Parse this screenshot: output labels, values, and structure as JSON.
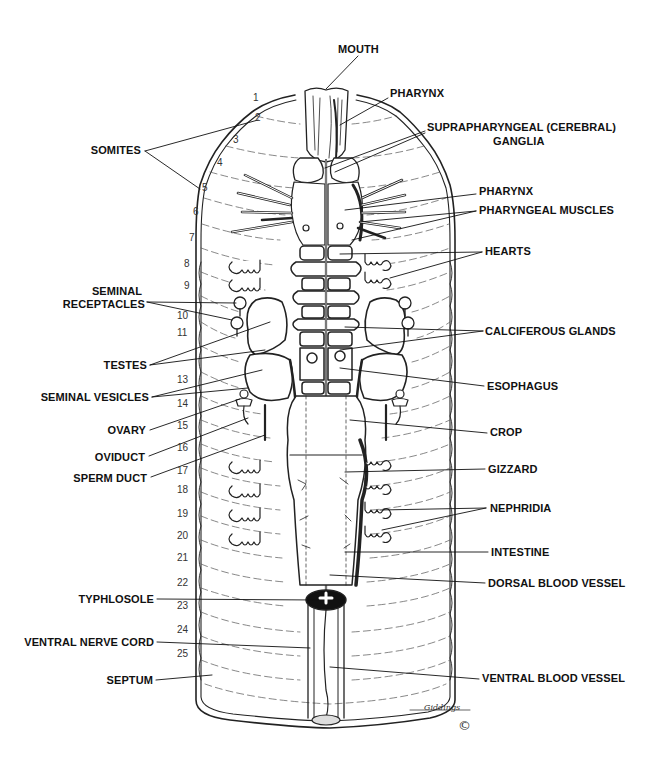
{
  "diagram": {
    "labels_right": [
      {
        "id": "mouth",
        "text": "MOUTH",
        "x": 338,
        "y": 49
      },
      {
        "id": "pharynx-top",
        "text": "PHARYNX",
        "x": 390,
        "y": 93
      },
      {
        "id": "supra-ganglia",
        "text": "SUPRAPHARYNGEAL (CEREBRAL)",
        "x": 427,
        "y": 127
      },
      {
        "id": "supra-ganglia-2",
        "text": "GANGLIA",
        "x": 493,
        "y": 141
      },
      {
        "id": "pharynx",
        "text": "PHARYNX",
        "x": 479,
        "y": 191
      },
      {
        "id": "pharyngeal-muscles",
        "text": "PHARYNGEAL MUSCLES",
        "x": 479,
        "y": 207
      },
      {
        "id": "hearts",
        "text": "HEARTS",
        "x": 485,
        "y": 249
      },
      {
        "id": "calciferous-glands",
        "text": "CALCIFEROUS GLANDS",
        "x": 485,
        "y": 327
      },
      {
        "id": "esophagus",
        "text": "ESOPHAGUS",
        "x": 487,
        "y": 383
      },
      {
        "id": "crop",
        "text": "CROP",
        "x": 490,
        "y": 429
      },
      {
        "id": "gizzard",
        "text": "GIZZARD",
        "x": 488,
        "y": 466
      },
      {
        "id": "nephridia",
        "text": "NEPHRIDIA",
        "x": 490,
        "y": 504
      },
      {
        "id": "intestine",
        "text": "INTESTINE",
        "x": 491,
        "y": 548
      },
      {
        "id": "dorsal-blood-vessel",
        "text": "DORSAL BLOOD VESSEL",
        "x": 488,
        "y": 580
      },
      {
        "id": "ventral-blood-vessel",
        "text": "VENTRAL BLOOD VESSEL",
        "x": 482,
        "y": 675
      }
    ],
    "labels_left": [
      {
        "id": "somites",
        "text": "SOMITES",
        "right": 141,
        "y": 148
      },
      {
        "id": "seminal-receptacles-1",
        "text": "SEMINAL",
        "right": 133,
        "y": 290
      },
      {
        "id": "seminal-receptacles-2",
        "text": "RECEPTACLES",
        "right": 145,
        "y": 303
      },
      {
        "id": "testes",
        "text": "TESTES",
        "right": 147,
        "y": 361
      },
      {
        "id": "seminal-vesicles",
        "text": "SEMINAL VESICLES",
        "right": 149,
        "y": 393
      },
      {
        "id": "ovary",
        "text": "OVARY",
        "right": 146,
        "y": 426
      },
      {
        "id": "oviduct",
        "text": "OVIDUCT",
        "right": 145,
        "y": 453
      },
      {
        "id": "sperm-duct",
        "text": "SPERM DUCT",
        "right": 147,
        "y": 474
      },
      {
        "id": "typhlosole",
        "text": "TYPHLOSOLE",
        "right": 154,
        "y": 595
      },
      {
        "id": "ventral-nerve-cord",
        "text": "VENTRAL NERVE CORD",
        "right": 154,
        "y": 638
      },
      {
        "id": "septum",
        "text": "SEPTUM",
        "right": 153,
        "y": 676
      }
    ],
    "somite_numbers": [
      {
        "n": "1",
        "x": 253,
        "y": 97
      },
      {
        "n": "2",
        "x": 255,
        "y": 117
      },
      {
        "n": "3",
        "x": 233,
        "y": 139
      },
      {
        "n": "4",
        "x": 217,
        "y": 161
      },
      {
        "n": "5",
        "x": 202,
        "y": 186
      },
      {
        "n": "6",
        "x": 193,
        "y": 210
      },
      {
        "n": "7",
        "x": 189,
        "y": 236
      },
      {
        "n": "8",
        "x": 184,
        "y": 262
      },
      {
        "n": "9",
        "x": 183,
        "y": 284
      },
      {
        "n": "10",
        "x": 177,
        "y": 314
      },
      {
        "n": "11",
        "x": 177,
        "y": 331
      },
      {
        "n": "13",
        "x": 177,
        "y": 378
      },
      {
        "n": "14",
        "x": 177,
        "y": 402
      },
      {
        "n": "15",
        "x": 177,
        "y": 424
      },
      {
        "n": "16",
        "x": 177,
        "y": 446
      },
      {
        "n": "17",
        "x": 177,
        "y": 469
      },
      {
        "n": "18",
        "x": 177,
        "y": 488
      },
      {
        "n": "19",
        "x": 177,
        "y": 512
      },
      {
        "n": "20",
        "x": 177,
        "y": 534
      },
      {
        "n": "21",
        "x": 177,
        "y": 556
      },
      {
        "n": "22",
        "x": 177,
        "y": 581
      },
      {
        "n": "23",
        "x": 177,
        "y": 604
      },
      {
        "n": "24",
        "x": 177,
        "y": 628
      },
      {
        "n": "25",
        "x": 177,
        "y": 652
      }
    ],
    "signature": "Giddings",
    "copyright_symbol": "©",
    "colors": {
      "ink": "#111111",
      "background": "#ffffff",
      "shade": "#222222"
    }
  }
}
